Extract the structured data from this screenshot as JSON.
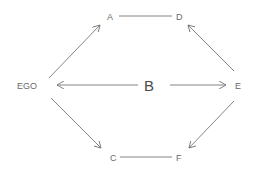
{
  "diagram": {
    "nodes": {
      "ego": "EGO",
      "a": "A",
      "d": "D",
      "b": "B",
      "e": "E",
      "c": "C",
      "f": "F"
    },
    "edges": [
      {
        "from": "EGO",
        "to": "A",
        "type": "arrow"
      },
      {
        "from": "A",
        "to": "D",
        "type": "line"
      },
      {
        "from": "E",
        "to": "D",
        "type": "arrow"
      },
      {
        "from": "B",
        "to": "EGO",
        "type": "arrow"
      },
      {
        "from": "B",
        "to": "E",
        "type": "arrow"
      },
      {
        "from": "EGO",
        "to": "C",
        "type": "arrow"
      },
      {
        "from": "C",
        "to": "F",
        "type": "line"
      },
      {
        "from": "E",
        "to": "F",
        "type": "arrow"
      }
    ],
    "line_color": "#777777"
  }
}
